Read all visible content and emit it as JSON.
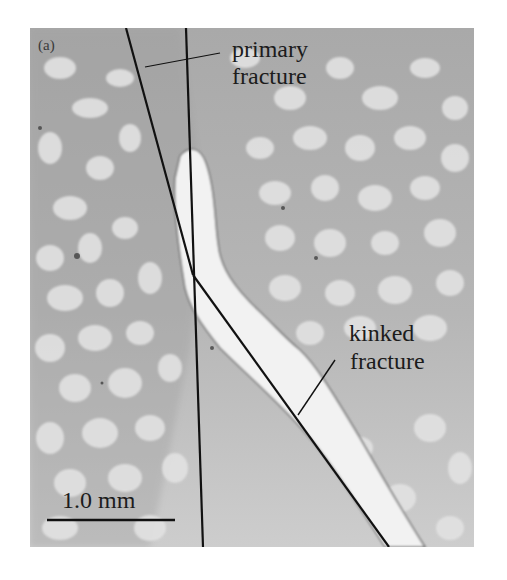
{
  "figure": {
    "panel_label": "(a)",
    "annotations": {
      "primary_line1": "primary",
      "primary_line2": "fracture",
      "kinked_line1": "kinked",
      "kinked_line2": "fracture"
    },
    "scale_bar": {
      "label": "1.0 mm"
    },
    "colors": {
      "background": "#ffffff",
      "matrix_gray": "#a8a8a8",
      "grain_light": "#e4e4e4",
      "fracture_fill": "#f3f3f3",
      "line": "#111111"
    }
  }
}
